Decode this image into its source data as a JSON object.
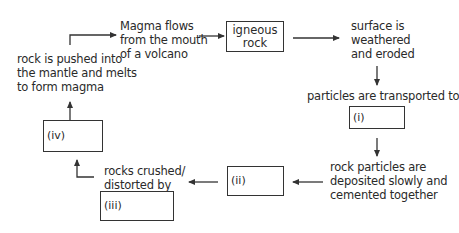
{
  "diagram": {
    "nodes": {
      "magma_flows": "Magma flows\nfrom the mouth\nof a volcano",
      "igneous_rock": [
        "igneous",
        "rock"
      ],
      "weathered": [
        "surface is",
        "weathered",
        "and eroded"
      ],
      "transported": "particles are transported to",
      "box_i": "(i)",
      "deposited": [
        "rock particles are",
        "deposited slowly and",
        "cemented together"
      ],
      "box_ii": "(ii)",
      "crushed": [
        "rocks crushed/",
        "distorted by"
      ],
      "box_iii": "(iii)",
      "box_iv": "(iv)",
      "melts": [
        "rock is pushed into",
        "the mantle and melts",
        "to form magma"
      ],
      "magma_lines": [
        "Magma flows",
        "from the mouth",
        "of a volcano"
      ]
    },
    "edges": [
      [
        "melts",
        "magma_flows"
      ],
      [
        "magma_flows",
        "igneous_rock"
      ],
      [
        "igneous_rock",
        "weathered"
      ],
      [
        "weathered",
        "transported"
      ],
      [
        "box_i",
        "deposited"
      ],
      [
        "deposited",
        "box_ii"
      ],
      [
        "box_ii",
        "crushed"
      ],
      [
        "crushed",
        "box_iv"
      ],
      [
        "box_iv",
        "melts"
      ]
    ],
    "colors": {
      "line": "#333333",
      "text": "#2a2a2a",
      "background": "#ffffff"
    }
  }
}
